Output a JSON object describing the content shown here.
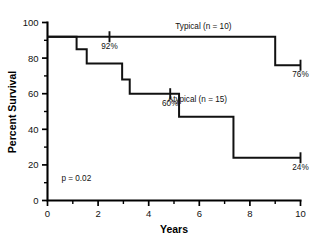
{
  "chart_data": {
    "type": "line",
    "subtype": "kaplan-meier-survival",
    "title": "",
    "xlabel": "Years",
    "ylabel": "Percent Survival",
    "xlim": [
      0,
      10
    ],
    "ylim": [
      0,
      100
    ],
    "grid": false,
    "legend_position": "inline-annotation",
    "x_ticks_major": [
      0,
      2,
      4,
      6,
      8,
      10
    ],
    "x_ticks_major_labels": [
      "0",
      "2",
      "4",
      "6",
      "8",
      "10"
    ],
    "x_ticks_minor": [
      1,
      3,
      5,
      7,
      9
    ],
    "y_ticks_major": [
      0,
      20,
      40,
      60,
      80,
      100
    ],
    "y_ticks_major_labels": [
      "0",
      "20",
      "40",
      "60",
      "80",
      "100"
    ],
    "y_ticks_minor": [
      10,
      30,
      50,
      70,
      90
    ],
    "annotations": [
      {
        "name": "p-value",
        "text": "p = 0.02",
        "x": 0.55,
        "y": 11
      }
    ],
    "series": [
      {
        "name": "Typical (n = 10)",
        "label": "Typical (n = 10)",
        "label_x": 5.05,
        "label_y": 96.5,
        "color": "#111111",
        "steps": [
          {
            "x": 0.0,
            "y": 92
          },
          {
            "x": 9.0,
            "y": 92
          },
          {
            "x": 9.0,
            "y": 76
          },
          {
            "x": 10.0,
            "y": 76
          }
        ],
        "censor_marks": [
          {
            "x": 2.45,
            "y": 92
          },
          {
            "x": 10.0,
            "y": 76
          }
        ],
        "point_labels": [
          {
            "text": "92%",
            "x": 2.45,
            "y": 92,
            "dy": 12
          },
          {
            "text": "76%",
            "x": 10.0,
            "y": 76,
            "dy": 12
          }
        ]
      },
      {
        "name": "Atypical (n = 15)",
        "label": "Atypical (n = 15)",
        "label_x": 4.75,
        "label_y": 55.5,
        "color": "#111111",
        "steps": [
          {
            "x": 0.0,
            "y": 92
          },
          {
            "x": 1.15,
            "y": 92
          },
          {
            "x": 1.15,
            "y": 85
          },
          {
            "x": 1.55,
            "y": 85
          },
          {
            "x": 1.55,
            "y": 77
          },
          {
            "x": 2.95,
            "y": 77
          },
          {
            "x": 2.95,
            "y": 68
          },
          {
            "x": 3.25,
            "y": 68
          },
          {
            "x": 3.25,
            "y": 60
          },
          {
            "x": 5.2,
            "y": 60
          },
          {
            "x": 5.2,
            "y": 47
          },
          {
            "x": 7.35,
            "y": 47
          },
          {
            "x": 7.35,
            "y": 24
          },
          {
            "x": 10.0,
            "y": 24
          }
        ],
        "censor_marks": [
          {
            "x": 4.85,
            "y": 60
          },
          {
            "x": 10.0,
            "y": 24
          }
        ],
        "point_labels": [
          {
            "text": "60%",
            "x": 4.85,
            "y": 60,
            "dy": 12
          },
          {
            "text": "24%",
            "x": 10.0,
            "y": 24,
            "dy": 12
          }
        ]
      }
    ]
  }
}
